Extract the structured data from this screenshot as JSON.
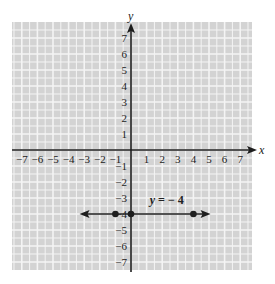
{
  "chart_data": {
    "type": "line",
    "title": "",
    "xlabel": "x",
    "ylabel": "y",
    "xlim": [
      -7.5,
      7.5
    ],
    "ylim": [
      -7.5,
      7.5
    ],
    "grid": true,
    "x_ticks": [
      "-7",
      "-6",
      "-5",
      "-4",
      "-3",
      "-2",
      "-1",
      "1",
      "2",
      "3",
      "4",
      "5",
      "6",
      "7"
    ],
    "y_ticks": [
      "7",
      "6",
      "5",
      "4",
      "3",
      "2",
      "1",
      "-1",
      "-2",
      "-3",
      "-4",
      "-5",
      "-6",
      "-7"
    ],
    "series": [
      {
        "name": "y = -4",
        "kind": "horizontal-line",
        "y": -4,
        "arrows": "both",
        "points": [
          {
            "x": -1,
            "y": -4
          },
          {
            "x": 0,
            "y": -4
          },
          {
            "x": 4,
            "y": -4
          }
        ]
      }
    ],
    "annotations": [
      {
        "text_var": "y",
        "text_rest": "= − 4",
        "x": 1.2,
        "y": -3.4
      }
    ]
  },
  "colors": {
    "grid_bg": "#d3d3d3",
    "grid_line": "#f4f4f4",
    "ink": "#1e1e1e"
  }
}
